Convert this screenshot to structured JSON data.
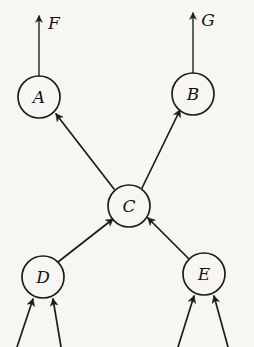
{
  "diagram": {
    "type": "directed-graph",
    "background_color": "#f7f6f3",
    "stroke_color": "#1d1c1a",
    "nodes": [
      {
        "id": "A",
        "label": "A",
        "cx": 39,
        "cy": 97,
        "r": 21
      },
      {
        "id": "B",
        "label": "B",
        "cx": 193,
        "cy": 94,
        "r": 21
      },
      {
        "id": "C",
        "label": "C",
        "cx": 129,
        "cy": 206,
        "r": 21
      },
      {
        "id": "D",
        "label": "D",
        "cx": 43,
        "cy": 277,
        "r": 21
      },
      {
        "id": "E",
        "label": "E",
        "cx": 204,
        "cy": 274,
        "r": 21
      }
    ],
    "edges": [
      {
        "id": "C-A",
        "from": "C",
        "to": "A",
        "x1": 114,
        "y1": 189,
        "x2": 56,
        "y2": 114
      },
      {
        "id": "C-B",
        "from": "C",
        "to": "B",
        "x1": 142,
        "y1": 188,
        "x2": 180,
        "y2": 110
      },
      {
        "id": "D-C",
        "from": "D",
        "to": "C",
        "x1": 58,
        "y1": 262,
        "x2": 113,
        "y2": 219
      },
      {
        "id": "E-C",
        "from": "E",
        "to": "C",
        "x1": 190,
        "y1": 260,
        "x2": 148,
        "y2": 218
      }
    ],
    "output_arrows": [
      {
        "id": "A-F",
        "from": "A",
        "label": "F",
        "x1": 39,
        "y1": 76,
        "x2": 39,
        "y2": 16,
        "label_x": 54,
        "label_y": 24
      },
      {
        "id": "B-G",
        "from": "B",
        "label": "G",
        "x1": 193,
        "y1": 73,
        "x2": 193,
        "y2": 13,
        "label_x": 208,
        "label_y": 21
      }
    ],
    "input_arrows": [
      {
        "id": "in-D-left",
        "to": "D",
        "x1": 17,
        "y1": 347,
        "x2": 33,
        "y2": 299
      },
      {
        "id": "in-D-right",
        "to": "D",
        "x1": 61,
        "y1": 347,
        "x2": 53,
        "y2": 299
      },
      {
        "id": "in-E-left",
        "to": "E",
        "x1": 178,
        "y1": 347,
        "x2": 194,
        "y2": 296
      },
      {
        "id": "in-E-right",
        "to": "E",
        "x1": 228,
        "y1": 347,
        "x2": 214,
        "y2": 296
      }
    ]
  }
}
